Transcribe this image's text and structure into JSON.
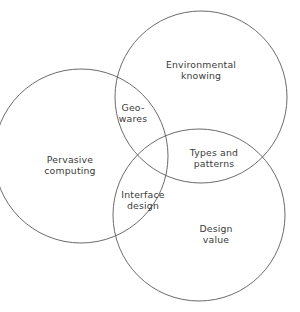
{
  "figure": {
    "type": "venn-diagram-3-set",
    "background_color": "#ffffff",
    "stroke_color": "#5a5a5a",
    "text_color": "#3a3a3a"
  },
  "sets": [
    {
      "id": "pervasive-computing",
      "label": "Pervasive\ncomputing",
      "cx": 81,
      "cy": 156,
      "r": 87
    },
    {
      "id": "environmental-knowing",
      "label": "Environmental\nknowing",
      "cx": 201,
      "cy": 97,
      "r": 86
    },
    {
      "id": "design-value",
      "label": "Design\nvalue",
      "cx": 199,
      "cy": 215,
      "r": 86
    }
  ],
  "intersections": [
    {
      "id": "geo-wares",
      "label": "Geo-\nwares",
      "between": [
        "pervasive-computing",
        "environmental-knowing"
      ]
    },
    {
      "id": "interface-design",
      "label": "Interface\ndesign",
      "between": [
        "pervasive-computing",
        "design-value"
      ]
    },
    {
      "id": "types-and-patterns",
      "label": "Types and\npatterns",
      "between": [
        "environmental-knowing",
        "design-value"
      ]
    }
  ]
}
